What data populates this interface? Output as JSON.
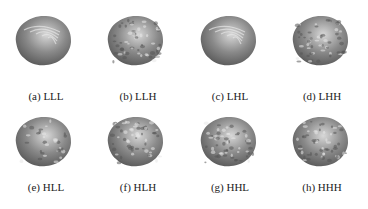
{
  "figure": {
    "panels": [
      {
        "id": "a",
        "label": "(a) LLL",
        "texture": "smooth"
      },
      {
        "id": "b",
        "label": "(b) LLH",
        "texture": "rough"
      },
      {
        "id": "c",
        "label": "(c) LHL",
        "texture": "smooth"
      },
      {
        "id": "d",
        "label": "(d) LHH",
        "texture": "rough"
      },
      {
        "id": "e",
        "label": "(e) HLL",
        "texture": "medium"
      },
      {
        "id": "f",
        "label": "(f) HLH",
        "texture": "rough"
      },
      {
        "id": "g",
        "label": "(g) HHL",
        "texture": "rough"
      },
      {
        "id": "h",
        "label": "(h) HHH",
        "texture": "rough"
      }
    ],
    "colors": {
      "base": "#8a8a8a",
      "highlight": "#d8d8d8",
      "shadow": "#5a5a5a"
    }
  }
}
